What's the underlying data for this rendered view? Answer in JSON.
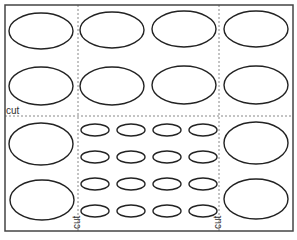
{
  "sheet": {
    "description": "Printable cut-out sheet of oval shapes",
    "frame": {
      "x": 5,
      "y": 5,
      "width": 288,
      "height": 226,
      "stroke": "#444444"
    },
    "stroke_color": "#222222",
    "dash_color": "#888888"
  },
  "cut_lines": {
    "horizontal": {
      "label": "cut",
      "y": 116,
      "x1": 5,
      "x2": 293
    },
    "vertical_left": {
      "label": "cut",
      "x": 78,
      "y1": 5,
      "y2": 231
    },
    "vertical_right": {
      "label": "cut",
      "x": 219,
      "y1": 5,
      "y2": 231
    }
  },
  "labels": {
    "horizontal_cut": "cut",
    "left_vertical_cut": "cut",
    "right_vertical_cut": "cut"
  },
  "large_ovals": [
    {
      "cx": 41,
      "cy": 31,
      "rx": 32,
      "ry": 18
    },
    {
      "cx": 112,
      "cy": 30,
      "rx": 32,
      "ry": 18
    },
    {
      "cx": 184,
      "cy": 29,
      "rx": 32,
      "ry": 18
    },
    {
      "cx": 256,
      "cy": 29,
      "rx": 32,
      "ry": 18
    },
    {
      "cx": 41,
      "cy": 86,
      "rx": 32,
      "ry": 19
    },
    {
      "cx": 112,
      "cy": 86,
      "rx": 32,
      "ry": 19
    },
    {
      "cx": 184,
      "cy": 85,
      "rx": 32,
      "ry": 19
    },
    {
      "cx": 256,
      "cy": 85,
      "rx": 32,
      "ry": 19
    },
    {
      "cx": 41,
      "cy": 144,
      "rx": 32,
      "ry": 21
    },
    {
      "cx": 256,
      "cy": 143,
      "rx": 32,
      "ry": 21
    },
    {
      "cx": 42,
      "cy": 200,
      "rx": 32,
      "ry": 20
    },
    {
      "cx": 256,
      "cy": 199,
      "rx": 32,
      "ry": 20
    }
  ],
  "small_ovals": {
    "columns_cx": [
      95,
      131,
      167,
      203
    ],
    "rows_cy": [
      130,
      157,
      184,
      211
    ],
    "rx": 14,
    "ry": 6
  }
}
